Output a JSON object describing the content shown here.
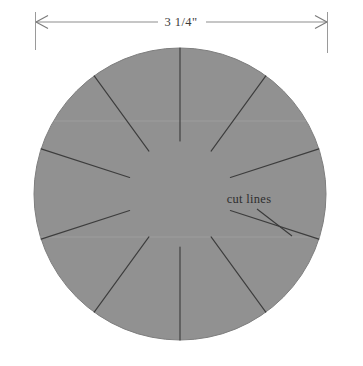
{
  "figure": {
    "background_color": "#ffffff",
    "width": 363,
    "height": 366
  },
  "dimension": {
    "label": "3 1/4\"",
    "label_x": 181,
    "label_y": 26,
    "line_y": 22,
    "x_start": 35,
    "x_end": 327,
    "line_color": "#8d8d8d",
    "extension_top": 12,
    "extension_bottom_left": 50,
    "extension_bottom_right": 53,
    "arrow_color": "#7b7b7b"
  },
  "disc": {
    "name": "gray-circle",
    "center_x": 180,
    "center_y": 194,
    "radius": 146,
    "fill_color": "#919191",
    "stroke_color": "#7e7e7e",
    "stroke_width": 1
  },
  "callout": {
    "label": "cut lines",
    "label_x": 249,
    "label_y": 203,
    "leader": {
      "x1": 257,
      "y1": 209,
      "x2": 292,
      "y2": 235,
      "color": "#3a3a3a"
    }
  },
  "cut_lines": {
    "count": 10,
    "color": "#3d3d3d",
    "width": 1.15,
    "segments": [
      {
        "name": "cut-line-1",
        "x1": 127,
        "y1": 60,
        "x2": 167,
        "y2": 158
      },
      {
        "name": "cut-line-2",
        "x1": 45,
        "y1": 143,
        "x2": 146,
        "y2": 183
      },
      {
        "name": "cut-line-3",
        "x1": 47,
        "y1": 258,
        "x2": 143,
        "y2": 218
      },
      {
        "name": "cut-line-4",
        "x1": 131,
        "y1": 331,
        "x2": 170,
        "y2": 232
      },
      {
        "name": "cut-line-5",
        "x1": 170,
        "y1": 232,
        "x2": 170,
        "y2": 232
      },
      {
        "name": "cut-line-6",
        "x1": 243,
        "y1": 327,
        "x2": 201,
        "y2": 230
      },
      {
        "name": "cut-line-7",
        "x1": 320,
        "y1": 240,
        "x2": 223,
        "y2": 210
      },
      {
        "name": "cut-line-8",
        "x1": 322,
        "y1": 138,
        "x2": 227,
        "y2": 178
      },
      {
        "name": "cut-line-9",
        "x1": 249,
        "y1": 66,
        "x2": 205,
        "y2": 158
      },
      {
        "name": "cut-line-10",
        "x1": 176,
        "y1": 48,
        "x2": 176,
        "y2": 48
      }
    ]
  },
  "cut_lines_geometry": {
    "note": "radial spokes from rim inward, stopping short of the center",
    "center_x": 180,
    "center_y": 194,
    "outer_radius": 146,
    "inner_radius": 53,
    "angles_deg": [
      252,
      288,
      324,
      0,
      36,
      72,
      108,
      144,
      180,
      216
    ]
  }
}
